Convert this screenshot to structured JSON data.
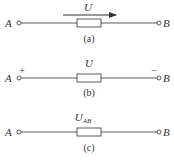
{
  "figures": [
    {
      "id": "a",
      "caption": "(a)",
      "left_terminal": "A",
      "right_terminal": "B",
      "voltage_label": "U",
      "direction": "arrow-right"
    },
    {
      "id": "b",
      "caption": "(b)",
      "left_terminal": "A",
      "right_terminal": "B",
      "voltage_label": "U",
      "left_polarity": "+",
      "right_polarity": "−"
    },
    {
      "id": "c",
      "caption": "(c)",
      "left_terminal": "A",
      "right_terminal": "B",
      "voltage_label": "U",
      "voltage_subscript": "AB"
    }
  ],
  "colors": {
    "stroke": "#333333",
    "background": "#ffffff"
  }
}
